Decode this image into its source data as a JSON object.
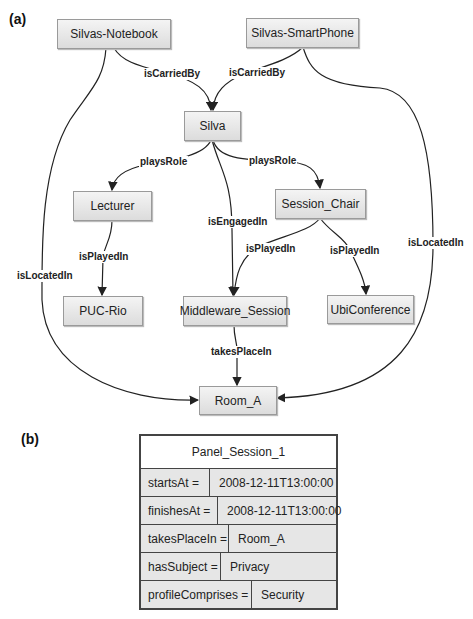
{
  "panels": {
    "a_label": "(a)",
    "b_label": "(b)"
  },
  "graph": {
    "nodes": {
      "notebook": "Silvas-Notebook",
      "smartphone": "Silvas-SmartPhone",
      "silva": "Silva",
      "lecturer": "Lecturer",
      "session_chair": "Session_Chair",
      "puc_rio": "PUC-Rio",
      "middleware_session": "Middleware_Session",
      "ubiconference": "UbiConference",
      "room_a": "Room_A"
    },
    "edges": {
      "notebook_silva": "isCarriedBy",
      "smartphone_silva": "isCarriedBy",
      "silva_lecturer": "playsRole",
      "silva_session_chair": "playsRole",
      "silva_middleware": "isEngagedIn",
      "lecturer_puc": "isPlayedIn",
      "chair_middleware": "isPlayedIn",
      "chair_ubiconference": "isPlayedIn",
      "notebook_room": "isLocatedIn",
      "smartphone_room": "isLocatedIn",
      "middleware_room": "takesPlaceIn"
    }
  },
  "instance_table": {
    "title": "Panel_Session_1",
    "rows": [
      {
        "key": "startsAt =",
        "value": "2008-12-11T13:00:00"
      },
      {
        "key": "finishesAt =",
        "value": "2008-12-11T13:00:00"
      },
      {
        "key": "takesPlaceIn =",
        "value": "Room_A"
      },
      {
        "key": "hasSubject =",
        "value": "Privacy"
      },
      {
        "key": "profileComprises =",
        "value": "Security"
      }
    ]
  }
}
